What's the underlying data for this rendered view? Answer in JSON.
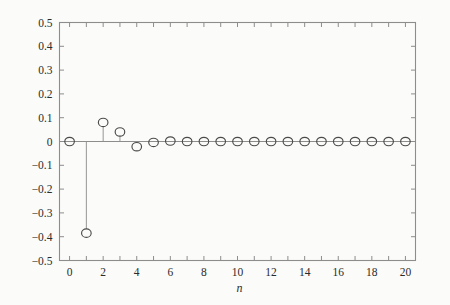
{
  "chart_data": {
    "type": "line",
    "title": "",
    "subtitle": "",
    "xlabel": "n",
    "ylabel": "",
    "xlim": [
      -0.6,
      20.6
    ],
    "ylim": [
      -0.5,
      0.5
    ],
    "grid": false,
    "legend": null,
    "marker_style": "open-circle",
    "stem_plot": true,
    "x": [
      0,
      1,
      2,
      3,
      4,
      5,
      6,
      7,
      8,
      9,
      10,
      11,
      12,
      13,
      14,
      15,
      16,
      17,
      18,
      19,
      20
    ],
    "values": [
      0.0,
      -0.385,
      0.08,
      0.04,
      -0.022,
      -0.004,
      0.002,
      0.0,
      0.0,
      0.0,
      0.0,
      0.0,
      0.0,
      0.0,
      0.0,
      0.0,
      0.0,
      0.0,
      0.0,
      0.0,
      0.0
    ],
    "xticks": [
      0,
      2,
      4,
      6,
      8,
      10,
      12,
      14,
      16,
      18,
      20
    ],
    "xtick_labels": [
      "0",
      "2",
      "4",
      "6",
      "8",
      "10",
      "12",
      "14",
      "16",
      "18",
      "20"
    ],
    "xminor_ticks": [
      1,
      3,
      5,
      7,
      9,
      11,
      13,
      15,
      17,
      19
    ],
    "yticks": [
      0.5,
      0.4,
      0.3,
      0.2,
      0.1,
      0,
      -0.1,
      -0.2,
      -0.3,
      -0.4,
      -0.5
    ],
    "ytick_labels": [
      "0.5",
      "0.4",
      "0.3",
      "0.2",
      "0.1",
      "0",
      "−0.1",
      "−0.2",
      "−0.3",
      "−0.4",
      "−0.5"
    ],
    "colors": {
      "axis": "#8d8d8d",
      "marker": "#4a4a4a",
      "stem": "#8b8b8b",
      "text": "#2b2b2b",
      "background": "#fbfbf9"
    }
  }
}
